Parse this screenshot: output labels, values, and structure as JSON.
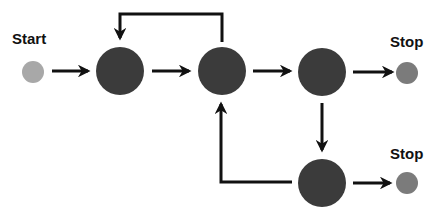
{
  "diagram": {
    "type": "state-flow",
    "colors": {
      "start_node": "#a8a8a8",
      "process_node": "#3b3b3b",
      "stop_node": "#7b7b7b",
      "arrow": "#111111",
      "background": "#ffffff"
    },
    "labels": {
      "start": "Start",
      "stop_top": "Stop",
      "stop_bottom": "Stop"
    },
    "nodes": [
      {
        "id": "start",
        "kind": "start",
        "label": "Start"
      },
      {
        "id": "n1",
        "kind": "process"
      },
      {
        "id": "n2",
        "kind": "process"
      },
      {
        "id": "n3",
        "kind": "process"
      },
      {
        "id": "stop1",
        "kind": "stop",
        "label": "Stop"
      },
      {
        "id": "n4",
        "kind": "process"
      },
      {
        "id": "stop2",
        "kind": "stop",
        "label": "Stop"
      }
    ],
    "edges": [
      {
        "from": "start",
        "to": "n1"
      },
      {
        "from": "n1",
        "to": "n2"
      },
      {
        "from": "n2",
        "to": "n1",
        "route": "over-top"
      },
      {
        "from": "n2",
        "to": "n3"
      },
      {
        "from": "n3",
        "to": "stop1"
      },
      {
        "from": "n3",
        "to": "n4"
      },
      {
        "from": "n4",
        "to": "stop2"
      },
      {
        "from": "n4",
        "to": "n2",
        "route": "left-then-up"
      }
    ]
  }
}
